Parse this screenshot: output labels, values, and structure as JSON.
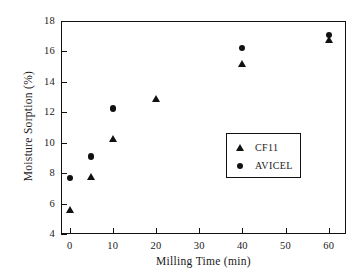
{
  "chart_data": {
    "type": "scatter",
    "title": "",
    "xlabel": "Milling Time (min)",
    "ylabel": "Moisture Sorption (%)",
    "xlim": [
      -2,
      64
    ],
    "ylim": [
      4,
      18
    ],
    "xticks": [
      0,
      10,
      20,
      30,
      40,
      50,
      60
    ],
    "yticks": [
      4,
      6,
      8,
      10,
      12,
      14,
      16,
      18
    ],
    "xtick_labels": [
      "0",
      "10",
      "20",
      "30",
      "40",
      "50",
      "60"
    ],
    "ytick_labels": [
      "4",
      "6",
      "8",
      "10",
      "12",
      "14",
      "16",
      "18"
    ],
    "grid": false,
    "legend_position": "lower right inside",
    "series": [
      {
        "name": "CF11",
        "marker": "triangle",
        "color": "#111111",
        "points": [
          {
            "x": 0,
            "y": 5.6
          },
          {
            "x": 5,
            "y": 7.75
          },
          {
            "x": 10,
            "y": 10.25
          },
          {
            "x": 20,
            "y": 12.9
          },
          {
            "x": 40,
            "y": 15.2
          },
          {
            "x": 60,
            "y": 16.75
          }
        ]
      },
      {
        "name": "AVICEL",
        "marker": "circle",
        "color": "#111111",
        "points": [
          {
            "x": 0,
            "y": 7.7
          },
          {
            "x": 5,
            "y": 9.1
          },
          {
            "x": 10,
            "y": 12.25
          },
          {
            "x": 40,
            "y": 16.2
          },
          {
            "x": 60,
            "y": 17.1
          }
        ]
      }
    ]
  },
  "legend": {
    "entries": [
      {
        "label": "CF11",
        "marker": "triangle"
      },
      {
        "label": "AVICEL",
        "marker": "circle"
      }
    ]
  },
  "colors": {
    "axis": "#111111",
    "marker": "#111111",
    "background": "#ffffff"
  }
}
